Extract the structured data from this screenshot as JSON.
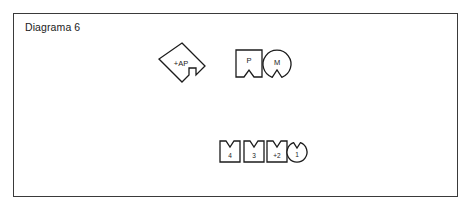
{
  "frame": {
    "title": "Diagrama 6",
    "border_color": "#3a3a3a",
    "background": "#ffffff"
  },
  "diagram": {
    "stroke_color": "#1b1b1b",
    "fill_color": "#ffffff",
    "text_color": "#1b1b1b",
    "nodes": [
      {
        "id": "node-ap",
        "label": "+AP",
        "shape": "diamond-notched",
        "notch_side": "right",
        "cx": 182,
        "cy": 67,
        "size": 38,
        "label_size": 7.5
      },
      {
        "id": "node-p",
        "label": "P",
        "shape": "square-notched",
        "notch_side": "bottom",
        "x": 236,
        "y": 50,
        "width": 26,
        "height": 27,
        "label_size": 7.5
      },
      {
        "id": "node-m",
        "label": "M",
        "shape": "circle-notched",
        "notch_side": "bottom",
        "cx": 277,
        "cy": 64,
        "radius": 14,
        "label_size": 7.5
      },
      {
        "id": "node-4",
        "label": "4",
        "shape": "square-notched",
        "notch_side": "top",
        "x": 220,
        "y": 141,
        "width": 20,
        "height": 21,
        "label_size": 6.5
      },
      {
        "id": "node-3",
        "label": "3",
        "shape": "square-notched",
        "notch_side": "top",
        "x": 244,
        "y": 141,
        "width": 20,
        "height": 21,
        "label_size": 6.5
      },
      {
        "id": "node-plus2",
        "label": "+2",
        "shape": "square-notched",
        "notch_side": "top",
        "x": 267,
        "y": 141,
        "width": 20,
        "height": 21,
        "label_size": 6.5
      },
      {
        "id": "node-1",
        "label": "1",
        "shape": "circle-notched",
        "notch_side": "top",
        "cx": 297,
        "cy": 152,
        "radius": 10,
        "label_size": 6.5
      }
    ]
  }
}
